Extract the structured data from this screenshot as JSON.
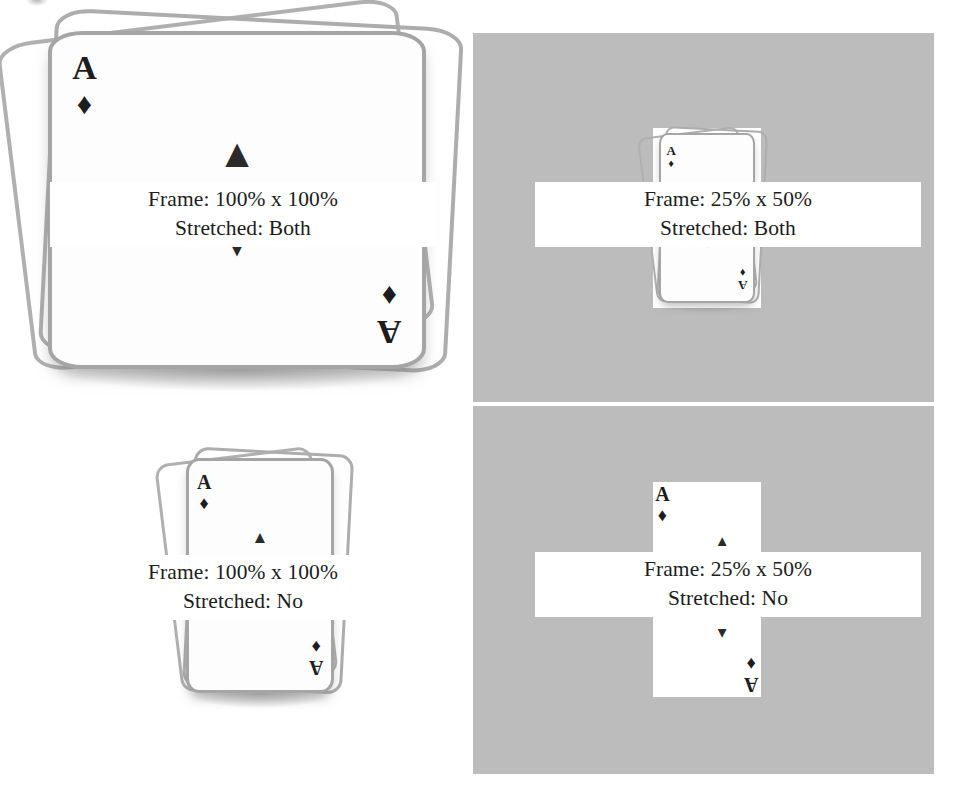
{
  "figure": {
    "description": "Four renderings of an ace-of-diamonds card stack demonstrating frame sizing and stretching",
    "background_color": "#ffffff",
    "plate_color": "#bcbcbc",
    "card_face_color": "#fdfdfd",
    "card_outline_color": "#a5a5a5",
    "pip_color": "#1d1d1d"
  },
  "cells": [
    {
      "id": "top-left",
      "frame_label": "Frame: 100% x 100%",
      "stretched_label": "Stretched: Both",
      "frame_width_pct": "100%",
      "frame_height_pct": "100%",
      "stretched": "Both",
      "has_plate": false,
      "card": {
        "rank": "A",
        "suit_glyph": "♦",
        "suit_name": "diamonds",
        "center_pip_glyph": "▲"
      }
    },
    {
      "id": "top-right",
      "frame_label": "Frame: 25% x 50%",
      "stretched_label": "Stretched: Both",
      "frame_width_pct": "25%",
      "frame_height_pct": "50%",
      "stretched": "Both",
      "has_plate": true,
      "card": {
        "rank": "A",
        "suit_glyph": "♦",
        "suit_name": "diamonds",
        "center_pip_glyph": "▲"
      }
    },
    {
      "id": "bottom-left",
      "frame_label": "Frame: 100% x 100%",
      "stretched_label": "Stretched: No",
      "frame_width_pct": "100%",
      "frame_height_pct": "100%",
      "stretched": "No",
      "has_plate": false,
      "card": {
        "rank": "A",
        "suit_glyph": "♦",
        "suit_name": "diamonds",
        "center_pip_glyph": "▲"
      }
    },
    {
      "id": "bottom-right",
      "frame_label": "Frame: 25% x 50%",
      "stretched_label": "Stretched: No",
      "frame_width_pct": "25%",
      "frame_height_pct": "50%",
      "stretched": "No",
      "has_plate": true,
      "card": {
        "rank": "A",
        "suit_glyph": "♦",
        "suit_name": "diamonds",
        "center_pip_glyph": "▲"
      }
    }
  ]
}
